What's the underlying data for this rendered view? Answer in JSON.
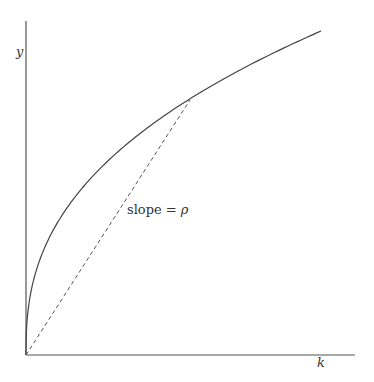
{
  "chart_data": {
    "type": "line",
    "title": "",
    "xlabel": "k",
    "ylabel": "y",
    "grid": false,
    "legend": null,
    "series": [
      {
        "name": "production function y = f(k)",
        "style": "solid",
        "shape": "concave, increasing from origin"
      },
      {
        "name": "ray from origin",
        "style": "dashed",
        "from": [
          0,
          0
        ],
        "to": "point on curve"
      }
    ],
    "annotations": [
      {
        "text": "slope = ρ",
        "target": "dashed ray"
      }
    ]
  },
  "labels": {
    "y_axis": "y",
    "x_axis": "k",
    "slope_text": "slope = ",
    "slope_symbol": "ρ"
  },
  "colors": {
    "line": "#444444",
    "text": "#333333",
    "background": "#ffffff"
  }
}
